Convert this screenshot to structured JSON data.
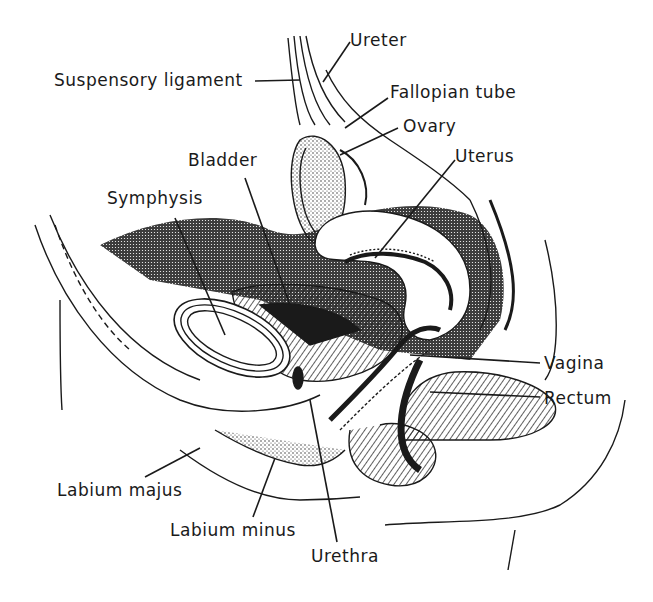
{
  "diagram": {
    "labels": {
      "ureter": "Ureter",
      "suspensory_ligament": "Suspensory ligament",
      "fallopian_tube": "Fallopian tube",
      "ovary": "Ovary",
      "uterus": "Uterus",
      "bladder": "Bladder",
      "symphysis": "Symphysis",
      "vagina": "Vagina",
      "rectum": "Rectum",
      "labium_majus": "Labium majus",
      "labium_minus": "Labium minus",
      "urethra": "Urethra"
    },
    "colors": {
      "ink": "#1a1a1a",
      "background": "#ffffff"
    }
  }
}
